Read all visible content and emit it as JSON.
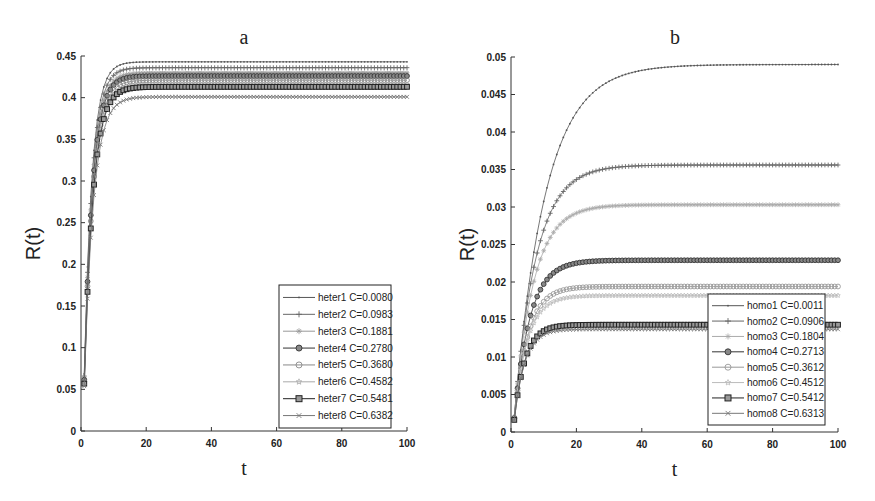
{
  "chart_data": [
    {
      "type": "line",
      "title": "a",
      "xlabel": "t",
      "ylabel": "R(t)",
      "xlim": [
        0,
        100
      ],
      "ylim": [
        0,
        0.45
      ],
      "xticks": [
        0,
        20,
        40,
        60,
        80,
        100
      ],
      "yticks": [
        0,
        0.05,
        0.1,
        0.15,
        0.2,
        0.25,
        0.3,
        0.35,
        0.4,
        0.45
      ],
      "ytick_labels": [
        "0",
        "0.05",
        "0.1",
        "0.15",
        "0.2",
        "0.25",
        "0.3",
        "0.35",
        "0.4",
        "0.45"
      ],
      "grid": false,
      "legend_position": "lower right",
      "series": [
        {
          "name": "heter1 C=0.0080",
          "marker": "point",
          "color": "#555555",
          "plateau": 0.443,
          "rate": 0.42
        },
        {
          "name": "heter2 C=0.0983",
          "marker": "plus",
          "color": "#666666",
          "plateau": 0.436,
          "rate": 0.41
        },
        {
          "name": "heter3 C=0.1881",
          "marker": "asterisk",
          "color": "#999999",
          "plateau": 0.43,
          "rate": 0.4
        },
        {
          "name": "heter4 C=0.2780",
          "marker": "circle-filled",
          "color": "#333333",
          "plateau": 0.426,
          "rate": 0.39
        },
        {
          "name": "heter5 C=0.3680",
          "marker": "circle",
          "color": "#888888",
          "plateau": 0.421,
          "rate": 0.38
        },
        {
          "name": "heter6 C=0.4582",
          "marker": "star",
          "color": "#aaaaaa",
          "plateau": 0.416,
          "rate": 0.37
        },
        {
          "name": "heter7 C=0.5481",
          "marker": "square",
          "color": "#222222",
          "plateau": 0.413,
          "rate": 0.37
        },
        {
          "name": "heter8 C=0.6382",
          "marker": "x",
          "color": "#777777",
          "plateau": 0.401,
          "rate": 0.36
        }
      ]
    },
    {
      "type": "line",
      "title": "b",
      "xlabel": "t",
      "ylabel": "R(t)",
      "xlim": [
        0,
        100
      ],
      "ylim": [
        0,
        0.05
      ],
      "xticks": [
        0,
        20,
        40,
        60,
        80,
        100
      ],
      "yticks": [
        0,
        0.005,
        0.01,
        0.015,
        0.02,
        0.025,
        0.03,
        0.035,
        0.04,
        0.045,
        0.05
      ],
      "ytick_labels": [
        "0",
        "0.005",
        "0.01",
        "0.015",
        "0.02",
        "0.025",
        "0.03",
        "0.035",
        "0.04",
        "0.045",
        "0.05"
      ],
      "grid": false,
      "legend_position": "lower right",
      "series": [
        {
          "name": "homo1 C=0.0011",
          "marker": "point",
          "color": "#555555",
          "plateau": 0.049,
          "rate": 0.105
        },
        {
          "name": "homo2 C=0.0906",
          "marker": "plus",
          "color": "#666666",
          "plateau": 0.0356,
          "rate": 0.15
        },
        {
          "name": "homo3 C=0.1804",
          "marker": "asterisk",
          "color": "#aaaaaa",
          "plateau": 0.0303,
          "rate": 0.17
        },
        {
          "name": "homo4 C=0.2713",
          "marker": "circle-filled",
          "color": "#333333",
          "plateau": 0.0229,
          "rate": 0.21
        },
        {
          "name": "homo5 C=0.3612",
          "marker": "circle",
          "color": "#999999",
          "plateau": 0.0194,
          "rate": 0.24
        },
        {
          "name": "homo6 C=0.4512",
          "marker": "star",
          "color": "#bbbbbb",
          "plateau": 0.0182,
          "rate": 0.25
        },
        {
          "name": "homo7 C=0.5412",
          "marker": "square",
          "color": "#222222",
          "plateau": 0.0143,
          "rate": 0.3
        },
        {
          "name": "homo8 C=0.6313",
          "marker": "x",
          "color": "#777777",
          "plateau": 0.0137,
          "rate": 0.31
        }
      ]
    }
  ],
  "layout": [
    {
      "left": 81,
      "right": 407,
      "top": 56,
      "bottom": 431,
      "title_x": 244,
      "title_y": 44,
      "legend": {
        "x": 279,
        "y": 285,
        "w": 112,
        "h": 143
      }
    },
    {
      "left": 511,
      "right": 838,
      "top": 57,
      "bottom": 432,
      "title_x": 675,
      "title_y": 44,
      "legend": {
        "x": 708,
        "y": 294,
        "w": 117,
        "h": 131
      }
    }
  ]
}
